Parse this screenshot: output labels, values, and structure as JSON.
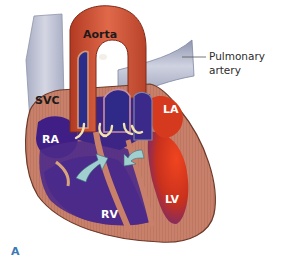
{
  "figure": {
    "panel_label": "A",
    "labels": {
      "aorta": "Aorta",
      "svc": "SVC",
      "pulmonary_artery_line1": "Pulmonary",
      "pulmonary_artery_line2": "artery",
      "ra": "RA",
      "la": "LA",
      "rv": "RV",
      "lv": "LV"
    },
    "colors": {
      "myocardium": "#c9806a",
      "myocardium_light": "#d99a84",
      "aorta": "#c44a2e",
      "aorta_light": "#e06a45",
      "deoxygenated": "#4a2a8a",
      "deoxygenated_dark": "#2c1f7a",
      "oxygenated": "#d63a1e",
      "vessel_grey": "#b9bdd0",
      "vessel_grey_dark": "#8d93ad",
      "arrow": "#9fd0cf",
      "valve": "#f1e2b0",
      "panel_letter": "#3b78b5"
    }
  }
}
